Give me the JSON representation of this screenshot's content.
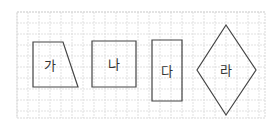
{
  "diagram": {
    "type": "shapes-on-grid",
    "grid": {
      "x0": 17,
      "y0": 12,
      "x1": 265,
      "y1": 118,
      "cell": 11,
      "line_color": "#d9d9d9",
      "border_color": "#cfcfcf"
    },
    "stroke_color": "#444444",
    "shapes": [
      {
        "id": "ga",
        "label": "가",
        "kind": "trapezoid",
        "points": "33,42 63,42 78,87 33,87",
        "label_x": 50,
        "label_y": 70
      },
      {
        "id": "na",
        "label": "나",
        "kind": "square",
        "points": "92,41 136,41 136,87 92,87",
        "label_x": 114,
        "label_y": 69
      },
      {
        "id": "da",
        "label": "다",
        "kind": "rectangle",
        "points": "152,40 182,40 182,101 152,101",
        "label_x": 167,
        "label_y": 76
      },
      {
        "id": "ra",
        "label": "라",
        "kind": "rhombus",
        "points": "226,25 256,70 226,115 197,70",
        "label_x": 226,
        "label_y": 75
      }
    ]
  }
}
